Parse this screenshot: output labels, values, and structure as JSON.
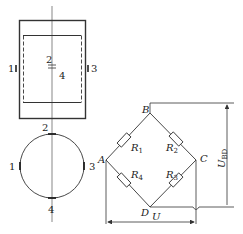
{
  "strain_gauge_view": {
    "labels": {
      "g1": "1",
      "g2": "2",
      "g3": "3",
      "g4": "4"
    }
  },
  "cross_section_view": {
    "labels": {
      "g1": "1",
      "g2": "2",
      "g3": "3",
      "g4": "4"
    }
  },
  "bridge": {
    "nodes": {
      "A": "A",
      "B": "B",
      "C": "C",
      "D": "D"
    },
    "resistors": {
      "r1": "R",
      "r1_sub": "1",
      "r2": "R",
      "r2_sub": "2",
      "r3": "R",
      "r3_sub": "3",
      "r4": "R",
      "r4_sub": "4"
    },
    "supply_voltage": "U",
    "output_voltage": "U",
    "output_voltage_sub": "BD"
  },
  "colors": {
    "line": "#333333",
    "text": "#222222"
  }
}
